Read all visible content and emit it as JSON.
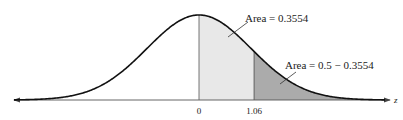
{
  "diagram": {
    "type": "normal-distribution",
    "axis": {
      "label": "z",
      "ticks": [
        {
          "value": 0,
          "label": "0"
        },
        {
          "value": 1.06,
          "label": "1.06"
        }
      ]
    },
    "regions": [
      {
        "name": "center-area",
        "from": 0,
        "to": 1.06,
        "label": "Area = 0.3554",
        "color": "#e6e6e6"
      },
      {
        "name": "tail-area",
        "from": 1.06,
        "to": "inf",
        "label": "Area = 0.5 − 0.3554",
        "color": "#a9a9a9"
      }
    ],
    "colors": {
      "curve": "#111111",
      "axis": "#555555",
      "divider": "#666666"
    }
  },
  "chart_data": {
    "type": "area",
    "title": "",
    "xlabel": "z",
    "ylabel": "",
    "distribution": "standard normal",
    "tick_labels": [
      "0",
      "1.06"
    ],
    "shaded_regions": [
      {
        "from": 0,
        "to": 1.06,
        "area": 0.3554,
        "label": "Area = 0.3554"
      },
      {
        "from": 1.06,
        "to": null,
        "area": 0.1446,
        "label": "Area = 0.5 − 0.3554"
      }
    ],
    "grid": false,
    "legend": "none"
  }
}
